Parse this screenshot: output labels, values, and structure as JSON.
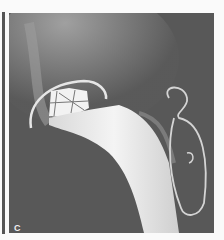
{
  "figure": {
    "panel_label": "C",
    "colors": {
      "background": "#fafafa",
      "film": "#5a5a5a",
      "implant": "#ececec",
      "bone": "#9a9a9a"
    }
  }
}
